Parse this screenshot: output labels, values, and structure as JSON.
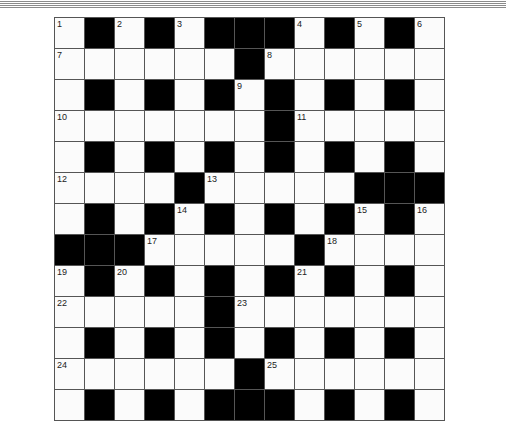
{
  "puzzle": {
    "type": "cryptic-crossword",
    "rows": 13,
    "cols": 13,
    "layout": [
      "W.W.W...W.W.W",
      "WWWWWW.WWWWWW",
      "W.W.W.W.W.W.W",
      "WWWWWWW.WWWWW",
      "W.W.W.W.W.W.W",
      "WWWW.WWWWW...",
      "W.W.W.W.W.W.W",
      "...WWWWW.WWWW",
      "W.W.W.W.W.W.W",
      "WWWWW.WWWWWWW",
      "W.W.W.W.W.W.W",
      "WWWWWW.WWWWWW",
      "W.W.W...W.W.W"
    ],
    "numbers": [
      {
        "n": "1",
        "r": 0,
        "c": 0
      },
      {
        "n": "2",
        "r": 0,
        "c": 2
      },
      {
        "n": "3",
        "r": 0,
        "c": 4
      },
      {
        "n": "4",
        "r": 0,
        "c": 8
      },
      {
        "n": "5",
        "r": 0,
        "c": 10
      },
      {
        "n": "6",
        "r": 0,
        "c": 12
      },
      {
        "n": "7",
        "r": 1,
        "c": 0
      },
      {
        "n": "8",
        "r": 1,
        "c": 7
      },
      {
        "n": "9",
        "r": 2,
        "c": 6
      },
      {
        "n": "10",
        "r": 3,
        "c": 0
      },
      {
        "n": "11",
        "r": 3,
        "c": 8
      },
      {
        "n": "12",
        "r": 5,
        "c": 0
      },
      {
        "n": "13",
        "r": 5,
        "c": 5
      },
      {
        "n": "14",
        "r": 6,
        "c": 4
      },
      {
        "n": "15",
        "r": 6,
        "c": 10
      },
      {
        "n": "16",
        "r": 6,
        "c": 12
      },
      {
        "n": "17",
        "r": 7,
        "c": 3
      },
      {
        "n": "18",
        "r": 7,
        "c": 9
      },
      {
        "n": "19",
        "r": 8,
        "c": 0
      },
      {
        "n": "20",
        "r": 8,
        "c": 2
      },
      {
        "n": "21",
        "r": 8,
        "c": 8
      },
      {
        "n": "22",
        "r": 9,
        "c": 0
      },
      {
        "n": "23",
        "r": 9,
        "c": 6
      },
      {
        "n": "24",
        "r": 11,
        "c": 0
      },
      {
        "n": "25",
        "r": 11,
        "c": 7
      }
    ]
  },
  "colors": {
    "black_cell": "#000000",
    "white_cell": "#fbfbfb",
    "grid_line": "#555555",
    "top_rule": "#8a8a8a"
  }
}
